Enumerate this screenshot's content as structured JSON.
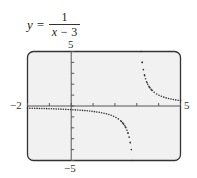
{
  "equation": {
    "lhs": "y =",
    "numerator": "1",
    "denominator_var": "x − ",
    "denominator_num": "3"
  },
  "window_labels": {
    "ymax": "5",
    "ymin": "−5",
    "xmin": "−2",
    "xmax": "5"
  },
  "colors": {
    "screen_bg": "#f1f1f1",
    "frame": "#333333",
    "axis": "#555555",
    "curve": "#333333"
  },
  "chart_data": {
    "type": "scatter",
    "function": "1/(x-3)",
    "xlabel": "",
    "ylabel": "",
    "xlim": [
      -2,
      5
    ],
    "ylim": [
      -5,
      5
    ],
    "xticks": [
      -2,
      -1,
      0,
      1,
      2,
      3,
      4,
      5
    ],
    "yticks": [
      -5,
      -4,
      -3,
      -2,
      -1,
      0,
      1,
      2,
      3,
      4,
      5
    ],
    "grid": false,
    "vertical_asymptote": 3,
    "horizontal_asymptote": 0,
    "style": "dotted",
    "series": [
      {
        "name": "left branch",
        "x": [
          -2,
          -1.5,
          -1,
          -0.5,
          0,
          0.5,
          1,
          1.5,
          2,
          2.25,
          2.5,
          2.6,
          2.7,
          2.8
        ],
        "y": [
          -0.2,
          -0.222,
          -0.25,
          -0.286,
          -0.333,
          -0.4,
          -0.5,
          -0.667,
          -1,
          -1.333,
          -2,
          -2.5,
          -3.333,
          -5
        ]
      },
      {
        "name": "right branch",
        "x": [
          3.2,
          3.3,
          3.4,
          3.5,
          3.75,
          4,
          4.5,
          5
        ],
        "y": [
          5,
          3.333,
          2.5,
          2,
          1.333,
          1,
          0.667,
          0.5
        ]
      }
    ]
  }
}
